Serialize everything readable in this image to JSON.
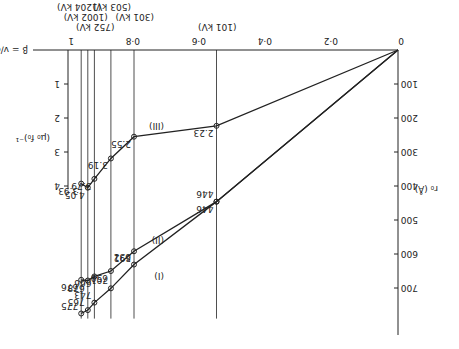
{
  "chart_data": {
    "type": "line",
    "orientation": "rotated 180 degrees",
    "xlabel": "β = v/c",
    "ylabel_left": "(μ₀ f₀)⁻¹",
    "ylabel_right": "r₀ (Å)",
    "x_ticks": [
      "0",
      "0·2",
      "0·4",
      "0·6",
      "0·8",
      "1"
    ],
    "r0_ticks": [
      "100",
      "200",
      "300",
      "400",
      "500",
      "600",
      "700"
    ],
    "inv_ticks": [
      "1",
      "2",
      "3",
      "4"
    ],
    "energies": [
      {
        "label": "(101 kV)",
        "beta": 0.55
      },
      {
        "label": "(301 kV)",
        "beta": 0.8
      },
      {
        "label": "(503 kV)",
        "beta": 0.87
      },
      {
        "label": "(752 kV)",
        "beta": 0.92
      },
      {
        "label": "(1002 kV)",
        "beta": 0.94
      },
      {
        "label": "(1204 kV)",
        "beta": 0.96
      }
    ],
    "series": [
      {
        "name": "(I)",
        "marker": "x",
        "points": [
          [
            0.55,
            446
          ],
          [
            0.8,
            631
          ],
          [
            0.87,
            701
          ],
          [
            0.92,
            743
          ],
          [
            0.94,
            765
          ],
          [
            0.96,
            775
          ]
        ]
      },
      {
        "name": "(II)",
        "marker": "circle-x",
        "points": [
          [
            0.55,
            446
          ],
          [
            0.8,
            592
          ],
          [
            0.87,
            650
          ],
          [
            0.92,
            666
          ],
          [
            0.94,
            678
          ],
          [
            0.96,
            676
          ]
        ]
      },
      {
        "name": "(III)",
        "marker": "circle-x",
        "points": [
          [
            0.55,
            2.23
          ],
          [
            0.8,
            2.55
          ],
          [
            0.87,
            3.19
          ],
          [
            0.92,
            3.79
          ],
          [
            0.94,
            4.05
          ],
          [
            0.96,
            3.93
          ]
        ]
      }
    ]
  }
}
